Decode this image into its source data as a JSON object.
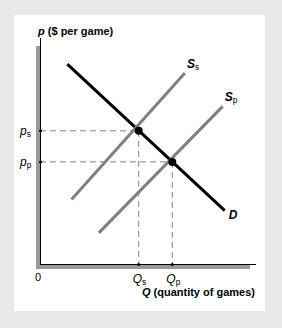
{
  "chart_data": {
    "type": "line",
    "title": "",
    "ylabel_var": "p",
    "ylabel_rest": " ($ per game)",
    "xlabel_var": "Q",
    "xlabel_rest": " (quantity of games)",
    "origin_label": "0",
    "xlim": [
      0,
      10
    ],
    "ylim": [
      0,
      10
    ],
    "series": [
      {
        "name": "D",
        "label_main": "D",
        "label_sub": "",
        "color": "#000000",
        "points": [
          [
            1.3,
            9.0
          ],
          [
            8.8,
            2.4
          ]
        ]
      },
      {
        "name": "Ss",
        "label_main": "S",
        "label_sub": "s",
        "color": "#808080",
        "points": [
          [
            1.5,
            2.9
          ],
          [
            6.9,
            8.6
          ]
        ]
      },
      {
        "name": "Sp",
        "label_main": "S",
        "label_sub": "p",
        "color": "#808080",
        "points": [
          [
            2.8,
            1.4
          ],
          [
            8.7,
            7.1
          ]
        ]
      }
    ],
    "equilibria": [
      {
        "name": "s",
        "x": 4.7,
        "y": 6.0,
        "p_label_main": "p",
        "p_label_sub": "s",
        "q_label_main": "Q",
        "q_label_sub": "s"
      },
      {
        "name": "p",
        "x": 6.3,
        "y": 4.6,
        "p_label_main": "p",
        "p_label_sub": "p",
        "q_label_main": "Q",
        "q_label_sub": "p"
      }
    ],
    "colors": {
      "axis": "#9a9a9a",
      "guide": "#808080",
      "background": "#e9e9e9",
      "panel": "#ffffff"
    }
  }
}
